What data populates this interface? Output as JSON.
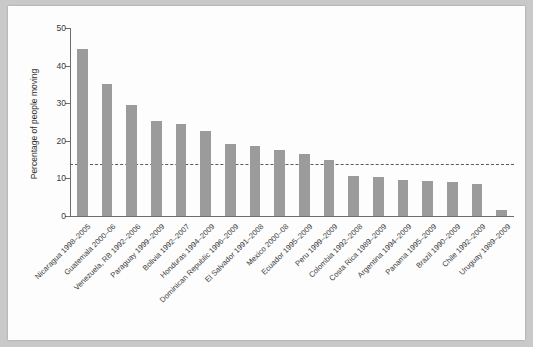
{
  "chart_data": {
    "type": "bar",
    "title": "",
    "xlabel": "",
    "ylabel": "Percentage of people moving",
    "ylim": [
      0,
      50
    ],
    "yticks": [
      0,
      10,
      20,
      30,
      40,
      50
    ],
    "ytick_labels": [
      "0",
      "10",
      "20",
      "30",
      "40",
      "50"
    ],
    "grid": false,
    "legend": "none",
    "reference_line": {
      "value": 13.8,
      "style": "dashed",
      "color": "#5b5b5b",
      "label": ""
    },
    "bar_color": "#9b9b9b",
    "categories": [
      "Nicaragua 1998–2005",
      "Guatemala 2000–06",
      "Venezuela, RB 1992–2006",
      "Paraguay 1999–2009",
      "Bolivia 1992–2007",
      "Honduras 1994–2009",
      "Dominican Republic 1996–2009",
      "El Salvador 1991–2008",
      "Mexico 2000–08",
      "Ecuador 1995–2009",
      "Peru 1999–2009",
      "Colombia 1992–2008",
      "Costa Rica 1989–2009",
      "Argentina 1994–2009",
      "Panama 1995–2009",
      "Brazil 1990–2009",
      "Chile 1992–2009",
      "Uruguay 1989–2009"
    ],
    "values": [
      44.5,
      35.0,
      29.4,
      25.3,
      24.6,
      22.7,
      19.1,
      18.5,
      17.6,
      16.6,
      14.8,
      10.6,
      10.4,
      9.5,
      9.3,
      9.0,
      8.6,
      1.5
    ]
  }
}
